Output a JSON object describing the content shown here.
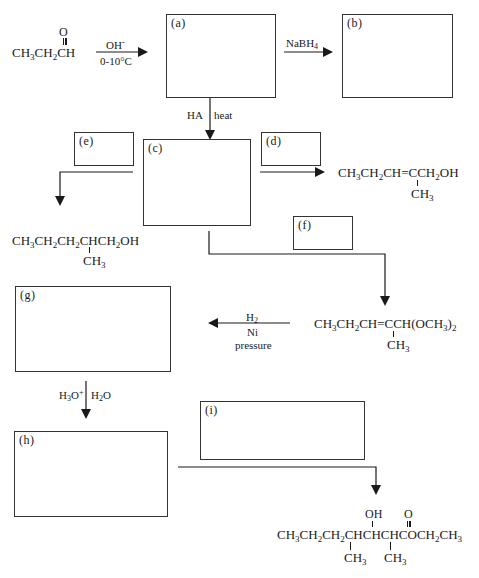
{
  "diagram": {
    "type": "reaction-scheme",
    "boxes": [
      {
        "id": "a",
        "label": "(a)"
      },
      {
        "id": "b",
        "label": "(b)"
      },
      {
        "id": "c",
        "label": "(c)"
      },
      {
        "id": "d",
        "label": "(d)"
      },
      {
        "id": "e",
        "label": "(e)"
      },
      {
        "id": "f",
        "label": "(f)"
      },
      {
        "id": "g",
        "label": "(g)"
      },
      {
        "id": "h",
        "label": "(h)"
      },
      {
        "id": "i",
        "label": "(i)"
      }
    ],
    "starting_material": {
      "carbonyl_o": "O",
      "formula_parts": [
        "CH",
        "3",
        "CH",
        "2",
        "CH"
      ],
      "name": "propanal"
    },
    "reagents": {
      "s_to_a_top": "OH",
      "s_to_a_top_sup": "-",
      "s_to_a_bottom": "0-10°C",
      "a_to_b_main": "NaBH",
      "a_to_b_sub": "4",
      "a_to_c_left": "HA",
      "a_to_c_right": "heat",
      "f_to_g_line1_main": "H",
      "f_to_g_line1_sub": "2",
      "f_to_g_line2": "Ni",
      "f_to_g_line3": "pressure",
      "g_to_h_left_main": "H",
      "g_to_h_left_sub": "3",
      "g_to_h_left_o": "O",
      "g_to_h_left_sup": "+",
      "g_to_h_right_main": "H",
      "g_to_h_right_sub": "2",
      "g_to_h_right_o": "O"
    },
    "products": {
      "d_product": {
        "main": [
          "CH",
          "3",
          "CH",
          "2",
          "CH=CCH",
          "2",
          "OH"
        ],
        "branch": [
          "CH",
          "3"
        ]
      },
      "e_product": {
        "main": [
          "CH",
          "3",
          "CH",
          "2",
          "CH",
          "2",
          "CHCH",
          "2",
          "OH"
        ],
        "branch": [
          "CH",
          "3"
        ]
      },
      "f_product": {
        "main": [
          "CH",
          "3",
          "CH",
          "2",
          "CH=CCH(OCH",
          "3",
          ")",
          "2"
        ],
        "branch": [
          "CH",
          "3"
        ]
      },
      "i_product": {
        "top_oh": "OH",
        "top_o": "O",
        "main": [
          "CH",
          "3",
          "CH",
          "2",
          "CH",
          "2",
          "CHCHCHCOCH",
          "2",
          "CH",
          "3"
        ],
        "branch1": [
          "CH",
          "3"
        ],
        "branch2": [
          "CH",
          "3"
        ]
      }
    }
  }
}
